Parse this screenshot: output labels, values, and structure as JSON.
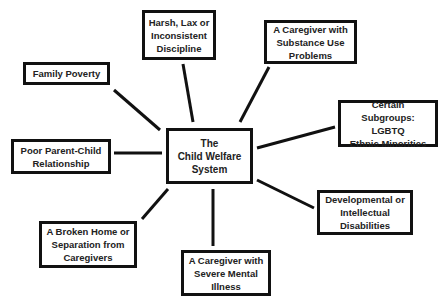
{
  "diagram": {
    "type": "hub-and-spoke",
    "center": {
      "label": "The\nChild Welfare\nSystem"
    },
    "nodes": [
      {
        "id": "harsh",
        "label": "Harsh, Lax or\nInconsistent\nDiscipline"
      },
      {
        "id": "substance",
        "label": "A Caregiver with\nSubstance Use\nProblems"
      },
      {
        "id": "poverty",
        "label": "Family Poverty"
      },
      {
        "id": "subgroups",
        "label": "Certain Subgroups:\nLGBTQ\nEthnic Minorities"
      },
      {
        "id": "parent_child",
        "label": "Poor Parent-Child\nRelationship"
      },
      {
        "id": "developmental",
        "label": "Developmental or\nIntellectual\nDisabilities"
      },
      {
        "id": "broken_home",
        "label": "A Broken Home or\nSeparation from\nCaregivers"
      },
      {
        "id": "mental_illness",
        "label": "A Caregiver with\nSevere Mental\nIllness"
      }
    ],
    "colors": {
      "line": "#111111",
      "border": "#111111",
      "text": "#222222",
      "background": "#ffffff"
    }
  }
}
